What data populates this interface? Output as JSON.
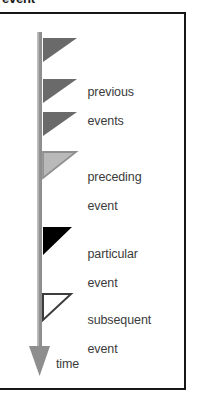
{
  "caption": {
    "text": "event"
  },
  "figure": {
    "axis_label": "time",
    "timeline": {
      "name": "time-axis",
      "orientation": "vertical",
      "direction": "downward",
      "color": "#8a8a8a",
      "arrowhead": "down"
    },
    "frame_color": "#161616",
    "background": "#ffffff"
  },
  "markers": [
    {
      "id": "previous-events",
      "label": "previous\nevents",
      "label_line1": "previous",
      "label_line2": "events",
      "glyph": "triangle-left",
      "count": 3,
      "fill": "#6a6a6a",
      "stroke": "#6a6a6a",
      "style": "solid-gray"
    },
    {
      "id": "preceding-event",
      "label": "preceding\nevent",
      "label_line1": "preceding",
      "label_line2": "event",
      "glyph": "triangle-left",
      "count": 1,
      "fill": "#b9b9b9",
      "stroke": "#8f8f8f",
      "style": "light-gray"
    },
    {
      "id": "particular-event",
      "label": "particular\nevent",
      "label_line1": "particular",
      "label_line2": "event",
      "glyph": "triangle-left",
      "count": 1,
      "fill": "#000000",
      "stroke": "#000000",
      "style": "solid-black"
    },
    {
      "id": "subsequent-event",
      "label": "subsequent\nevent",
      "label_line1": "subsequent",
      "label_line2": "event",
      "glyph": "triangle-left",
      "count": 1,
      "fill": "#ffffff",
      "stroke": "#3d3d3d",
      "style": "hollow-outline"
    }
  ]
}
